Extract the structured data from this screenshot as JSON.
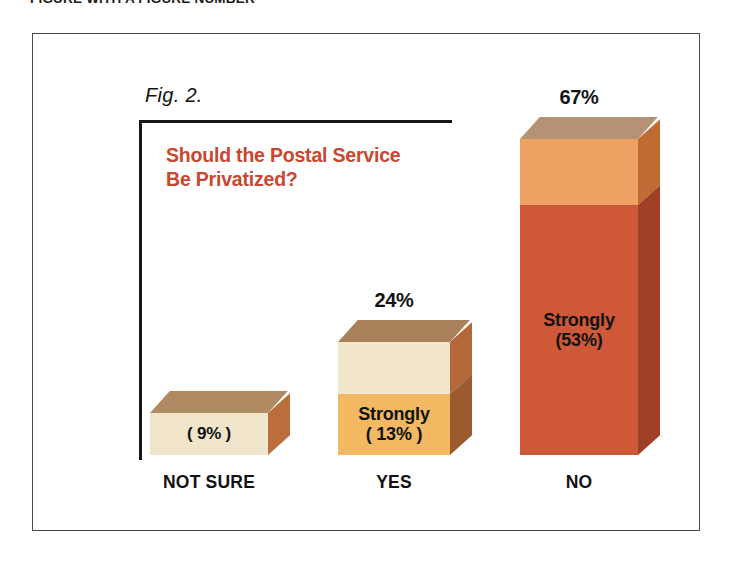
{
  "page": {
    "caption": "FIGURE WITH A FIGURE NUMBER"
  },
  "figure": {
    "number_label": "Fig. 2.",
    "title": "Should the Postal Service\nBe Privatized?",
    "title_color": "#c8472e"
  },
  "chart_data": {
    "type": "bar",
    "title": "Should the Postal Service Be Privatized?",
    "xlabel": "",
    "ylabel": "",
    "ylim": [
      0,
      70
    ],
    "grid": false,
    "legend": "none",
    "style": "3d-stacked-bar",
    "categories": [
      "NOT SURE",
      "YES",
      "NO"
    ],
    "values": [
      9,
      24,
      67
    ],
    "value_labels": [
      "",
      "24%",
      "67%"
    ],
    "bars": [
      {
        "category": "NOT SURE",
        "total": 9,
        "total_label": "",
        "segments": [
          {
            "name": "total",
            "value": 9,
            "label": "( 9% )",
            "front_color": "#f0e5cb",
            "top_color": "#b08a63",
            "side_color": "#b96e3c"
          }
        ]
      },
      {
        "category": "YES",
        "total": 24,
        "total_label": "24%",
        "segments": [
          {
            "name": "somewhat",
            "value": 11,
            "label": "",
            "front_color": "#f2e6cc",
            "top_color": "#a9825c",
            "side_color": "#b4683a"
          },
          {
            "name": "strongly",
            "value": 13,
            "label": "Strongly\n( 13% )",
            "front_color": "#f2b962",
            "top_color": "#a9825c",
            "side_color": "#9c5a2f"
          }
        ]
      },
      {
        "category": "NO",
        "total": 67,
        "total_label": "67%",
        "segments": [
          {
            "name": "somewhat",
            "value": 14,
            "label": "",
            "front_color": "#eda263",
            "top_color": "#b59274",
            "side_color": "#c06a34"
          },
          {
            "name": "strongly",
            "value": 53,
            "label": "Strongly\n(53%)",
            "front_color": "#cf5838",
            "top_color": "#b59274",
            "side_color": "#9e3f26"
          }
        ]
      }
    ]
  }
}
